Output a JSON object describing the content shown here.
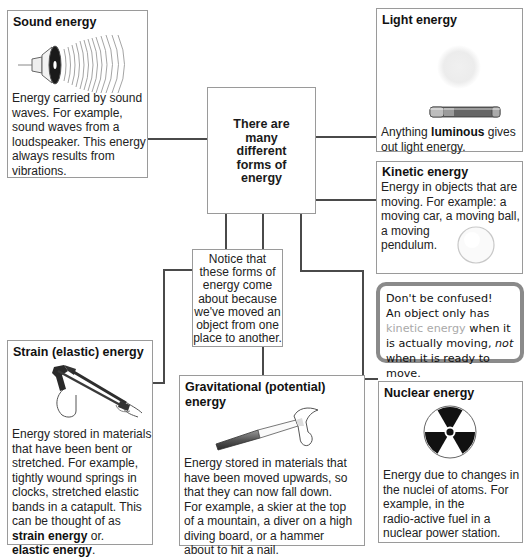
{
  "center": {
    "text_lines": [
      "There are",
      "many",
      "different",
      "forms of",
      "energy"
    ]
  },
  "notice": {
    "text_lines": [
      "Notice that",
      "these forms of",
      "energy come",
      "about because",
      "we've moved an",
      "object from one",
      "place to another."
    ]
  },
  "sound": {
    "title": "Sound energy",
    "icon": "loudspeaker-icon",
    "text_lines": [
      "Energy carried by sound",
      "waves. For example,",
      "sound waves from a",
      "loudspeaker. This energy",
      "always results from",
      "vibrations."
    ]
  },
  "light": {
    "title": "Light energy",
    "icon": "flashlight-icon",
    "text_pre": "Anything ",
    "text_bold": "luminous",
    "text_post": " gives",
    "text_line2": "out light energy."
  },
  "kinetic": {
    "title": "Kinetic energy",
    "icon": "pendulum-bob-icon",
    "text_lines": [
      "Energy in objects that are",
      "moving. For example: a",
      "moving car, a moving ball,",
      "a moving",
      "pendulum."
    ]
  },
  "note": {
    "line1": "Don't be confused!",
    "line2": "An object only has",
    "highlight": "kinetic energy",
    "line3_post": " when it",
    "line4_pre": "is actually moving, ",
    "line4_italic": "not",
    "line5": "when it is ready to move.",
    "border_color": "#8a8a8a",
    "highlight_color": "#a9a9a9"
  },
  "strain": {
    "title": "Strain (elastic) energy",
    "icon": "catapult-icon",
    "text_lines": [
      "Energy stored in materials",
      "that have been bent or",
      "stretched. For example,",
      "tightly wound springs in",
      "clocks, stretched elastic",
      "bands in a catapult. This",
      "can be thought of as"
    ],
    "bold1": "strain energy",
    "after_bold1": " or.",
    "bold2": "elastic energy",
    "after_bold2": "."
  },
  "gravitational": {
    "title_line1": "Gravitational (potential)",
    "title_line2": "energy",
    "icon": "hammer-icon",
    "text_lines": [
      "Energy stored in materials that",
      "have been moved upwards, so",
      "that they can now fall down.",
      "For example, a skier at the top",
      "of a mountain, a diver on a high",
      "diving board, or a hammer",
      "about to hit a nail."
    ]
  },
  "nuclear": {
    "title": "Nuclear energy",
    "icon": "radiation-icon",
    "text_lines": [
      "Energy due to changes in",
      "the nuclei of atoms. For",
      "example, in the",
      "radio-active fuel in a",
      "nuclear power station."
    ]
  },
  "colors": {
    "line": "#4a4a4a",
    "box_border": "#9a9a9a",
    "text": "#222222"
  }
}
